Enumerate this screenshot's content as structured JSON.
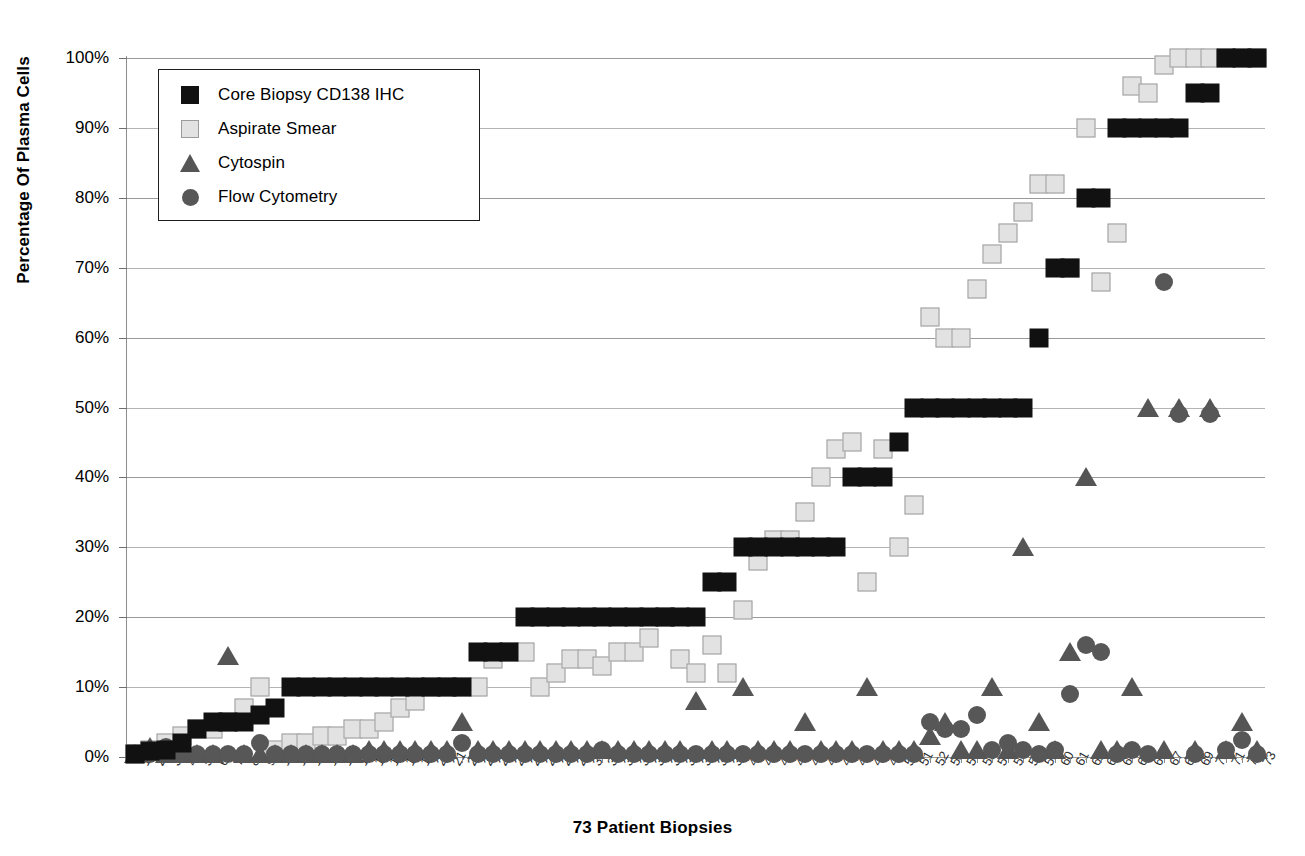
{
  "top_artifact_text": "",
  "chart_data": {
    "type": "scatter",
    "title": "",
    "xlabel": "73 Patient Biopsies",
    "ylabel": "Percentage Of Plasma Cells",
    "ylim": [
      0,
      100
    ],
    "ytick_labels": [
      "0%",
      "10%",
      "20%",
      "30%",
      "40%",
      "50%",
      "60%",
      "70%",
      "80%",
      "90%",
      "100%"
    ],
    "ytick_values": [
      0,
      10,
      20,
      30,
      40,
      50,
      60,
      70,
      80,
      90,
      100
    ],
    "grid": true,
    "legend_position": "top-left-inside",
    "x": [
      1,
      2,
      3,
      4,
      5,
      6,
      7,
      8,
      9,
      10,
      11,
      12,
      13,
      14,
      15,
      16,
      17,
      18,
      19,
      20,
      21,
      22,
      23,
      24,
      25,
      26,
      27,
      28,
      29,
      30,
      31,
      32,
      33,
      34,
      35,
      36,
      37,
      38,
      39,
      40,
      41,
      42,
      43,
      44,
      45,
      46,
      47,
      48,
      49,
      50,
      51,
      52,
      53,
      54,
      55,
      56,
      57,
      58,
      59,
      60,
      61,
      62,
      63,
      64,
      65,
      66,
      67,
      68,
      69,
      70,
      71,
      72,
      73
    ],
    "x_tick_labels": [
      "1",
      "2",
      "3",
      "4",
      "5",
      "6",
      "7",
      "8",
      "9",
      "10",
      "11",
      "12",
      "13",
      "14",
      "15",
      "16",
      "17",
      "18",
      "19",
      "20",
      "21",
      "22",
      "23",
      "24",
      "25",
      "26",
      "27",
      "28",
      "29",
      "30",
      "31",
      "32",
      "33",
      "34",
      "35",
      "36",
      "37",
      "38",
      "39",
      "40",
      "41",
      "42",
      "43",
      "44",
      "45",
      "46",
      "47",
      "48",
      "49",
      "50",
      "51",
      "52",
      "53",
      "54",
      "55",
      "56",
      "57",
      "58",
      "59",
      "60",
      "61",
      "62",
      "63",
      "64",
      "65",
      "66",
      "67",
      "68",
      "69",
      "70",
      "71",
      "72",
      "73"
    ],
    "series": [
      {
        "name": "Core Biopsy CD138 IHC",
        "marker": "square",
        "color": "#111111",
        "values": [
          0.5,
          0.8,
          1,
          2,
          4,
          5,
          5,
          5,
          6,
          7,
          10,
          10,
          10,
          10,
          10,
          10,
          10,
          10,
          10,
          10,
          10,
          10,
          15,
          15,
          15,
          20,
          20,
          20,
          20,
          20,
          20,
          20,
          20,
          20,
          20,
          20,
          20,
          25,
          25,
          30,
          30,
          30,
          30,
          30,
          30,
          30,
          40,
          40,
          40,
          45,
          50,
          50,
          50,
          50,
          50,
          50,
          50,
          50,
          60,
          70,
          70,
          80,
          80,
          90,
          90,
          90,
          90,
          90,
          95,
          95,
          100,
          100,
          100
        ]
      },
      {
        "name": "Aspirate  Smear",
        "marker": "square",
        "color": "#e2e2e2",
        "values": [
          0.5,
          1,
          2,
          3,
          4,
          4,
          5,
          7,
          10,
          1,
          2,
          2,
          3,
          3,
          4,
          4,
          5,
          7,
          8,
          10,
          10,
          10,
          10,
          14,
          15,
          15,
          10,
          12,
          14,
          14,
          13,
          15,
          15,
          17,
          20,
          14,
          12,
          16,
          12,
          21,
          28,
          31,
          31,
          35,
          40,
          44,
          45,
          25,
          44,
          30,
          36,
          63,
          60,
          60,
          67,
          72,
          75,
          78,
          82,
          82,
          70,
          90,
          68,
          75,
          96,
          95,
          99,
          100,
          100,
          100,
          100,
          100,
          100
        ]
      },
      {
        "name": "Cytospin",
        "marker": "triangle",
        "color": "#555555",
        "values": [
          0.5,
          1.5,
          0.5,
          0.5,
          0.5,
          0.5,
          14.5,
          0.5,
          0.5,
          0.5,
          0.5,
          0.5,
          0.5,
          0.5,
          0.5,
          1,
          1,
          1,
          1,
          1,
          1,
          5,
          1,
          1,
          1,
          1,
          1,
          1,
          1,
          1,
          1,
          1,
          1,
          1,
          1,
          1,
          8,
          1,
          1,
          10,
          1,
          1,
          1,
          5,
          1,
          1,
          1,
          10,
          1,
          1,
          1,
          3,
          5,
          1,
          1,
          10,
          1,
          30,
          5,
          1,
          15,
          40,
          1,
          1,
          10,
          50,
          1,
          50,
          1,
          50,
          1,
          5,
          1
        ]
      },
      {
        "name": "Flow Cytometry",
        "marker": "circle",
        "color": "#575757",
        "values": [
          0.5,
          0.5,
          1.5,
          0.5,
          0.5,
          0.5,
          0.5,
          0.5,
          2,
          0.5,
          0.5,
          0.5,
          0.5,
          0.5,
          0.5,
          0.5,
          0.5,
          0.5,
          0.5,
          0.5,
          0.5,
          2,
          0.5,
          0.5,
          0.5,
          0.5,
          0.5,
          0.5,
          0.5,
          0.5,
          1,
          0.5,
          0.5,
          0.5,
          0.5,
          0.5,
          0.5,
          0.5,
          0.5,
          0.5,
          0.5,
          0.5,
          0.5,
          0.5,
          0.5,
          0.5,
          0.5,
          0.5,
          0.5,
          0.5,
          0.5,
          5,
          4,
          4,
          6,
          1,
          2,
          1,
          0.5,
          1,
          9,
          16,
          15,
          0.5,
          1,
          0.5,
          68,
          49,
          0.5,
          49,
          1,
          2.5,
          0.5
        ]
      }
    ]
  },
  "legend": {
    "items": [
      {
        "label": "Core Biopsy CD138 IHC",
        "key": "black-square-key"
      },
      {
        "label": "Aspirate  Smear",
        "key": "gray-square-key"
      },
      {
        "label": "Cytospin",
        "key": "gray-triangle-key"
      },
      {
        "label": "Flow Cytometry",
        "key": "gray-circle-key"
      }
    ]
  },
  "colors": {
    "core_biopsy": "#111111",
    "aspirate_smear": "#e2e2e2",
    "cytospin": "#555555",
    "flow_cytometry": "#575757",
    "gridline": "#9a9a9a",
    "background": "#ffffff"
  }
}
